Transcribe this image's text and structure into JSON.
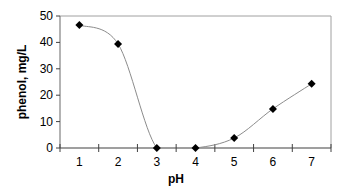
{
  "chart_data": {
    "type": "line",
    "title": "",
    "xlabel": "pH",
    "ylabel": "phenol, mg/L",
    "categories": [
      "1",
      "2",
      "3",
      "4",
      "5",
      "6",
      "7"
    ],
    "x": [
      1,
      2,
      3,
      4,
      5,
      6,
      7
    ],
    "series": [
      {
        "name": "phenol",
        "values": [
          46.6,
          39.4,
          0,
          0,
          3.8,
          14.8,
          24.3
        ],
        "marker": "diamond",
        "line": "smoothed"
      }
    ],
    "yticks": [
      0,
      10,
      20,
      30,
      40,
      50
    ],
    "ylim": [
      0,
      50
    ],
    "grid": false,
    "legend": "none",
    "colors": {
      "line": "#8c8c8c",
      "marker": "#000000",
      "axis": "#808080",
      "frame": "#a0a0a0"
    }
  }
}
